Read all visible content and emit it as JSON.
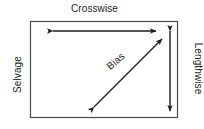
{
  "diagram": {
    "background_color": "#ffffff",
    "line_color": "#1c1c1c",
    "text_color": "#1c1c1c",
    "labels": {
      "crosswise": "Crosswise",
      "selvage": "Selvage",
      "lengthwise": "Lengthwise",
      "bias": "Bias"
    },
    "shapes": {
      "fabric_rectangle": {
        "x": 30,
        "y": 21,
        "width": 148,
        "height": 97
      },
      "crosswise_arrow": {
        "orientation": "horizontal",
        "double_headed": true,
        "x1": 52,
        "y1": 31,
        "x2": 157,
        "y2": 31
      },
      "lengthwise_arrow": {
        "orientation": "vertical",
        "double_headed": true,
        "x1": 170,
        "y1": 30,
        "x2": 170,
        "y2": 112
      },
      "bias_arrow": {
        "orientation": "diagonal",
        "double_headed": true,
        "x1": 93,
        "y1": 108,
        "x2": 163,
        "y2": 38,
        "angle_degrees": -45
      }
    }
  }
}
